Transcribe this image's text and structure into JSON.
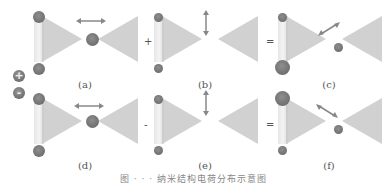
{
  "legend": {
    "positive": {
      "symbol": "+",
      "meaning": "positive-charge"
    },
    "negative": {
      "symbol": "-",
      "meaning": "negative-charge"
    }
  },
  "panels": [
    {
      "label": "(a)",
      "arrow": "horizontal",
      "operator_before": ""
    },
    {
      "label": "(b)",
      "arrow": "vertical",
      "operator_before": "+"
    },
    {
      "label": "(c)",
      "arrow": "diagonal-up-right",
      "operator_before": "="
    },
    {
      "label": "(d)",
      "arrow": "horizontal",
      "operator_before": ""
    },
    {
      "label": "(e)",
      "arrow": "vertical",
      "operator_before": "-"
    },
    {
      "label": "(f)",
      "arrow": "diagonal-down-right",
      "operator_before": "="
    }
  ],
  "operators": {
    "plus": "+",
    "minus": "-",
    "equals1": "=",
    "equals2": "="
  },
  "caption": "图 · · ·  纳米结构电荷分布示意图",
  "colors": {
    "shape": "#c9c9c9",
    "charge": "#7a7a7a",
    "arrow": "#888888",
    "text": "#555555"
  }
}
